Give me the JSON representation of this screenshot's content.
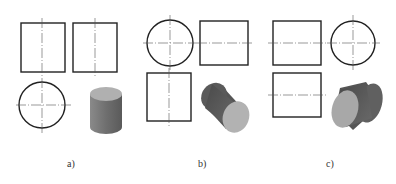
{
  "figure": {
    "panels": [
      {
        "id": "a",
        "label": "a)",
        "description": "Cylinder with vertical axis: front view rectangle, side view rectangle, top view circle, 3D isometric view"
      },
      {
        "id": "b",
        "label": "b)",
        "description": "Cylinder with axis front-to-back: front view circle, side view rectangle, top view rectangle, 3D isometric view"
      },
      {
        "id": "c",
        "label": "c)",
        "description": "Cylinder with horizontal axis left-to-right: front view rectangle, side view circle, top view rectangle, 3D isometric view"
      }
    ],
    "colors": {
      "line": "#222222",
      "centerline": "#555555",
      "cylinder_side_light": "#9a9a9a",
      "cylinder_side_dark": "#555555",
      "cylinder_cap": "#b5b5b5"
    }
  }
}
